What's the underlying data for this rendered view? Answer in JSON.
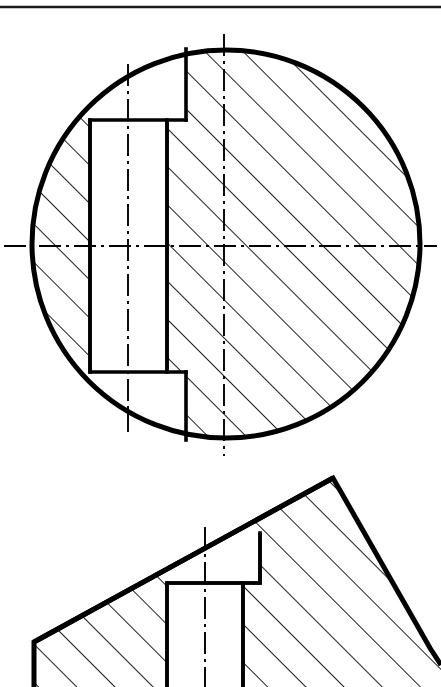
{
  "document": {
    "title": "Sectional Technical Drawing",
    "type": "engineering-section-view",
    "background_color": "#ffffff",
    "line_color": "#000000",
    "canvas": {
      "width": 441,
      "height": 687
    }
  },
  "border": {
    "top_rule": {
      "name": "top-border-rule",
      "x1": 0,
      "y1": 7,
      "x2": 441,
      "y2": 7,
      "stroke_width": 2.2,
      "color": "#1a1a1a"
    }
  },
  "views": [
    {
      "id": "view-top",
      "name": "circular-section-view",
      "label": "Circular cross-section with T-slot keyway",
      "shape": "circle",
      "circle": {
        "cx": 226,
        "cy": 244,
        "r": 196
      },
      "outline_stroke_width": 5.0,
      "internal_stroke_width": 3.4,
      "slot": {
        "name": "t-slot-keyway",
        "wide_right_x": 186,
        "narrow_left_x": 90,
        "narrow_right_x": 167,
        "top_ledge_y": 120,
        "bottom_ledge_y": 372,
        "top_open_y": 49,
        "bottom_open_y": 440
      },
      "centerlines": {
        "horizontal": {
          "x1": 4,
          "y": 246,
          "x2": 437
        },
        "vertical_main": {
          "x": 224,
          "y1": 34,
          "y2": 456
        },
        "vertical_slot": {
          "x": 128,
          "y1": 64,
          "y2": 432
        }
      },
      "hatch": {
        "angle_deg": 45,
        "spacing": 27,
        "stroke_width": 1.9
      }
    },
    {
      "id": "view-bottom",
      "name": "inclined-section-view",
      "label": "Inclined surface section with T-slot",
      "shape": "polygon",
      "outline_stroke_width": 5.0,
      "internal_stroke_width": 3.4,
      "outline_points": "34,642 34,700 441,700 441,660 430,648 333,478 160,578 120,578",
      "apex": {
        "x": 333,
        "y": 478
      },
      "left_corner": {
        "x": 34,
        "y": 642
      },
      "right_corner": {
        "x": 430,
        "y": 648
      },
      "slot": {
        "name": "t-slot-keyway",
        "wide_right_x": 260,
        "narrow_left_x": 167,
        "narrow_right_x": 243,
        "ledge_y": 583,
        "wide_top_right_y": 533,
        "bottom_y": 687
      },
      "centerlines": {
        "vertical_slot": {
          "x": 205,
          "y1": 527,
          "y2": 687
        }
      },
      "hatch": {
        "angle_deg": 45,
        "spacing": 27,
        "stroke_width": 1.9
      }
    }
  ],
  "linestyles": {
    "centerline_dash": "22,5,3,5",
    "centerline_width": 1.9
  }
}
